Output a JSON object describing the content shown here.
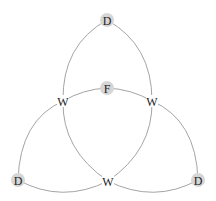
{
  "diagram": {
    "type": "graph",
    "colors": {
      "edge": "#9a9a9a",
      "node_fill": "#d6d6d6",
      "label": "#222222"
    },
    "nodes": [
      {
        "id": "d_top",
        "label": "D",
        "x": 107,
        "y": 20,
        "shaded": true
      },
      {
        "id": "f_center",
        "label": "F",
        "x": 107,
        "y": 88,
        "shaded": true
      },
      {
        "id": "w_left",
        "label": "W",
        "x": 63,
        "y": 101,
        "shaded": false
      },
      {
        "id": "w_right",
        "label": "W",
        "x": 152,
        "y": 101,
        "shaded": false
      },
      {
        "id": "d_bottom_left",
        "label": "D",
        "x": 18,
        "y": 180,
        "shaded": true
      },
      {
        "id": "w_bottom",
        "label": "W",
        "x": 108,
        "y": 181,
        "shaded": false
      },
      {
        "id": "d_bottom_right",
        "label": "D",
        "x": 198,
        "y": 180,
        "shaded": true
      }
    ],
    "edges": [
      {
        "from": "d_top",
        "to": "w_left"
      },
      {
        "from": "d_top",
        "to": "w_right"
      },
      {
        "from": "w_left",
        "to": "f_center"
      },
      {
        "from": "f_center",
        "to": "w_right"
      },
      {
        "from": "w_left",
        "to": "w_bottom"
      },
      {
        "from": "w_right",
        "to": "w_bottom"
      },
      {
        "from": "w_left",
        "to": "d_bottom_left"
      },
      {
        "from": "w_right",
        "to": "d_bottom_right"
      },
      {
        "from": "d_bottom_left",
        "to": "w_bottom"
      },
      {
        "from": "w_bottom",
        "to": "d_bottom_right"
      }
    ]
  }
}
